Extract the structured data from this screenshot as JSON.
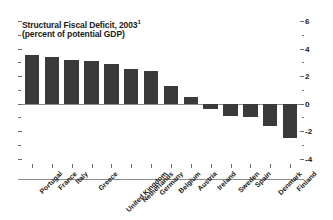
{
  "chart_data": {
    "type": "bar",
    "title": "Structural Fiscal Deficit, 2003",
    "title_superscript": "1",
    "subtitle": "(percent of potential GDP)",
    "xlabel": "",
    "ylabel": "",
    "ylim": [
      -4,
      6
    ],
    "yticks": [
      6,
      4,
      2,
      0,
      -2,
      -4
    ],
    "ytick_labels": [
      "6",
      "4",
      "2",
      "0",
      "-2",
      "-4"
    ],
    "minor_ticks": [
      5,
      3,
      1,
      -1,
      -3
    ],
    "grid": false,
    "legend": "none",
    "axis_position": "right",
    "bar_color": "#3a3a3a",
    "axis_color": "#8c8c8c",
    "categories": [
      "Portugal",
      "France",
      "Italy",
      "Greece",
      "United Kingdom",
      "Netherlands",
      "Germany",
      "Belgium",
      "Austria",
      "Ireland",
      "Sweden",
      "Spain",
      "Denmark",
      "Finland"
    ],
    "values": [
      3.5,
      3.4,
      3.2,
      3.1,
      2.9,
      2.5,
      2.4,
      1.3,
      0.5,
      -0.4,
      -0.9,
      -1.0,
      -1.6,
      -2.5
    ]
  }
}
